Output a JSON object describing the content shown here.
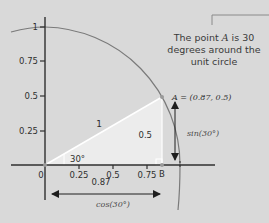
{
  "caption": {
    "prefix": "The point ",
    "point_name": "A",
    "suffix": " is 30 degrees around the unit circle"
  },
  "axes": {
    "x_ticks": [
      "0.25",
      "0.5",
      "0.75"
    ],
    "y_ticks": [
      "0.25",
      "0.5",
      "0.75",
      "1"
    ],
    "origin_label": "0"
  },
  "triangle": {
    "hypotenuse_label": "1",
    "opposite_label": "0.5",
    "adjacent_label": "0.87",
    "angle_label": "30°"
  },
  "points": {
    "A_label": "A = (0.87, 0.5)",
    "B_label": "B"
  },
  "measures": {
    "sin_label": "sin(30°)",
    "cos_label": "cos(30°)"
  },
  "colors": {
    "background": "#d9d9d9",
    "triangle_fill": "#ececec",
    "axis": "#2f2f2f",
    "circle": "#7a7a7a",
    "text": "#3a3a3a"
  }
}
